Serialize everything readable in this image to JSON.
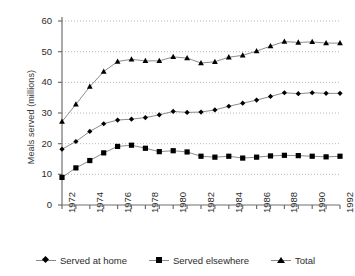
{
  "chart_data": {
    "type": "line",
    "title": "",
    "subtitle": "",
    "xlabel": "",
    "ylabel": "Meals served (millions)",
    "xlim": [
      1972,
      1992
    ],
    "ylim": [
      0,
      60
    ],
    "yticks": [
      0,
      10,
      20,
      30,
      40,
      50,
      60
    ],
    "grid": true,
    "grid_axis": "y",
    "legend_position": "bottom",
    "x": [
      1972,
      1973,
      1974,
      1975,
      1976,
      1977,
      1978,
      1979,
      1980,
      1981,
      1982,
      1983,
      1984,
      1985,
      1986,
      1987,
      1988,
      1989,
      1990,
      1991,
      1992
    ],
    "xtick_labels": [
      "1972",
      "1974",
      "1976",
      "1978",
      "1980",
      "1982",
      "1984",
      "1986",
      "1988",
      "1990",
      "1992"
    ],
    "xtick_values": [
      1972,
      1974,
      1976,
      1978,
      1980,
      1982,
      1984,
      1986,
      1988,
      1990,
      1992
    ],
    "series": [
      {
        "name": "Served at home",
        "marker": "diamond",
        "color": "#000000",
        "values": [
          18.2,
          20.7,
          24.0,
          26.5,
          27.7,
          28.0,
          28.5,
          29.4,
          30.5,
          30.2,
          30.3,
          31.0,
          32.2,
          33.2,
          34.2,
          35.4,
          36.6,
          36.3,
          36.6,
          36.4,
          36.4
        ]
      },
      {
        "name": "Served elsewhere",
        "marker": "square",
        "color": "#000000",
        "values": [
          9.0,
          12.1,
          14.5,
          17.0,
          19.1,
          19.5,
          18.5,
          17.4,
          17.7,
          17.3,
          15.9,
          15.6,
          15.9,
          15.3,
          15.6,
          16.0,
          16.2,
          16.1,
          15.9,
          15.7,
          15.9
        ]
      },
      {
        "name": "Total",
        "marker": "triangle",
        "color": "#000000",
        "values": [
          27.2,
          32.8,
          38.6,
          43.5,
          46.8,
          47.5,
          47.0,
          47.0,
          48.3,
          47.9,
          46.3,
          46.7,
          48.2,
          48.8,
          50.2,
          51.8,
          53.3,
          53.0,
          53.2,
          52.8,
          52.8
        ]
      }
    ]
  },
  "legend": {
    "items": [
      {
        "label": "Served at home"
      },
      {
        "label": "Served elsewhere"
      },
      {
        "label": "Total"
      }
    ]
  }
}
